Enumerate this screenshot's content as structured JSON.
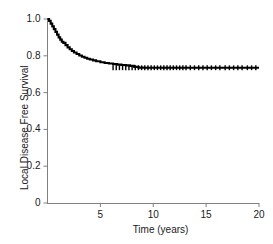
{
  "chart_data": {
    "type": "line",
    "title": "",
    "subtitle": "",
    "xlabel": "Time (years)",
    "ylabel": "Local Disease Free Survival",
    "xlim": [
      0,
      20
    ],
    "ylim": [
      0,
      1.0
    ],
    "xticks": [
      5,
      10,
      15,
      20
    ],
    "xtick_labels": [
      "5",
      "10",
      "15",
      "20"
    ],
    "yticks": [
      0,
      0.2,
      0.4,
      0.6,
      0.8,
      1.0
    ],
    "ytick_labels": [
      "0",
      "0.2",
      "0.4",
      "0.6",
      "0.8",
      "1.0"
    ],
    "grid": false,
    "legend": null,
    "line_color": "#000000",
    "axis_color": "#808080",
    "series": [
      {
        "name": "Local disease free survival",
        "style": "kaplan-meier-step",
        "x": [
          0.0,
          0.15,
          0.3,
          0.45,
          0.6,
          0.75,
          0.9,
          1.05,
          1.2,
          1.35,
          1.5,
          1.7,
          1.9,
          2.1,
          2.3,
          2.5,
          2.75,
          3.0,
          3.25,
          3.5,
          3.75,
          4.0,
          4.3,
          4.6,
          5.0,
          5.4,
          5.8,
          6.2,
          6.6,
          7.0,
          7.4,
          7.8,
          8.2,
          8.6,
          9.0,
          10.0,
          12.0,
          14.0,
          16.0,
          18.0,
          20.0
        ],
        "y": [
          1.0,
          0.99,
          0.975,
          0.96,
          0.945,
          0.93,
          0.915,
          0.9,
          0.888,
          0.876,
          0.87,
          0.858,
          0.846,
          0.836,
          0.826,
          0.818,
          0.81,
          0.802,
          0.795,
          0.789,
          0.784,
          0.78,
          0.775,
          0.77,
          0.765,
          0.761,
          0.758,
          0.755,
          0.752,
          0.75,
          0.748,
          0.745,
          0.74,
          0.736,
          0.735,
          0.735,
          0.735,
          0.735,
          0.735,
          0.735,
          0.735
        ]
      }
    ],
    "censor_marks": {
      "symbol": "tick",
      "y_level": 0.735,
      "x": [
        6.2,
        6.5,
        6.8,
        7.1,
        7.4,
        7.7,
        8.0,
        8.3,
        8.6,
        8.9,
        9.2,
        9.5,
        9.8,
        10.1,
        10.4,
        10.7,
        11.0,
        11.3,
        11.6,
        11.9,
        12.2,
        12.5,
        12.8,
        13.1,
        13.5,
        13.9,
        14.3,
        14.7,
        15.1,
        15.5,
        15.9,
        16.3,
        16.8,
        17.2,
        17.6,
        18.0,
        18.4,
        18.9,
        19.3,
        19.7
      ]
    },
    "annotations": []
  },
  "axes": {
    "y_title": "Local Disease Free Survival",
    "x_title": "Time (years)"
  }
}
